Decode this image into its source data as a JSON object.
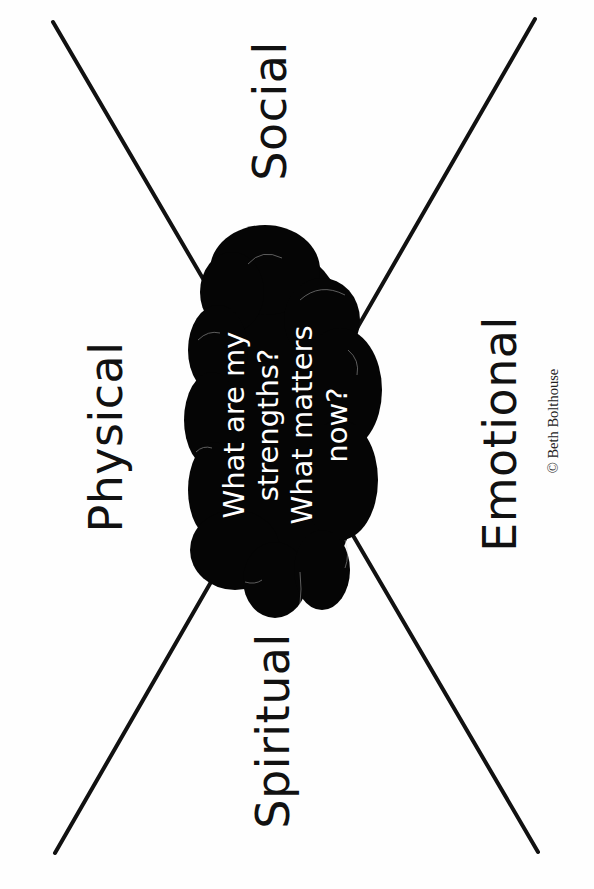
{
  "diagram": {
    "type": "x-quadrant-worksheet",
    "orientation": "rotated -90deg",
    "colors": {
      "background": "#fefefe",
      "lines": "#111111",
      "cloud_fill": "#050505",
      "cloud_text": "#ffffff",
      "label_text": "#111111"
    },
    "quadrants": {
      "top": "Social",
      "left": "Physical",
      "bottom": "Spiritual",
      "right": "Emotional"
    },
    "center_cloud": {
      "line1": "What are my",
      "line2": "strengths?",
      "line3": "What matters",
      "line4": "now?"
    },
    "copyright": "© Beth Bolthouse"
  }
}
